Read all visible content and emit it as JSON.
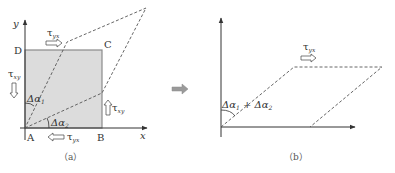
{
  "figure_a": {
    "caption": "（a）",
    "axis_x_label": "x",
    "axis_y_label": "y",
    "corners": {
      "A": "A",
      "B": "B",
      "C": "C",
      "D": "D"
    },
    "tau_top": {
      "symbol": "τ",
      "sub": "yx"
    },
    "tau_bottom": {
      "symbol": "τ",
      "sub": "yx"
    },
    "tau_left": {
      "symbol": "τ",
      "sub": "xy"
    },
    "tau_right": {
      "symbol": "τ",
      "sub": "xy"
    },
    "angle_1": {
      "symbol": "Δα",
      "sub": "1"
    },
    "angle_2": {
      "symbol": "Δα",
      "sub": "2"
    },
    "colors": {
      "square_fill": "#dcdcdc",
      "square_edge": "#8a8a8a",
      "dashed": "#555555",
      "axis": "#333333"
    }
  },
  "transition_arrow": {
    "color": "#9a9a9a"
  },
  "figure_b": {
    "caption": "（b）",
    "tau_top": {
      "symbol": "τ",
      "sub": "yx"
    },
    "angle_sum": {
      "a": "Δα",
      "a_sub": "1",
      "plus": " + ",
      "b": "Δα",
      "b_sub": "2"
    }
  }
}
